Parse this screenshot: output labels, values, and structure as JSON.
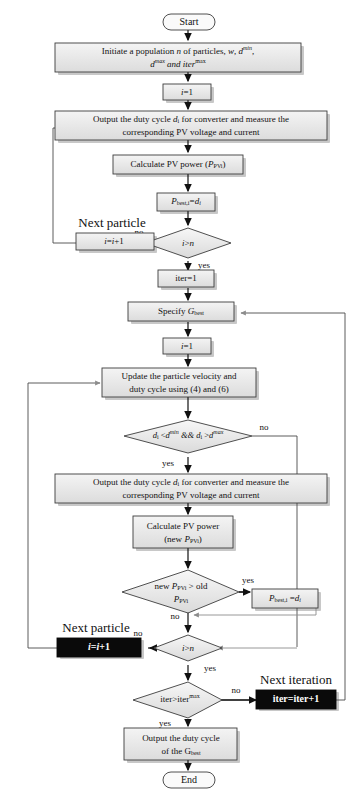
{
  "diagram": {
    "type": "flowchart",
    "colors": {
      "box_fill": "#e8e8e8",
      "box_stroke": "#3c3c3c",
      "black_box_fill": "#0a0a0a",
      "black_box_text": "#ffffff",
      "line": "#111111",
      "gray_line": "#8c8c8c",
      "shadow": "#9a9a9a"
    },
    "nodes": {
      "start": {
        "shape": "terminator",
        "label": "Start"
      },
      "initiate": {
        "shape": "process",
        "line1_a": "Initiate a population ",
        "line1_n": "n",
        "line1_b": " of particles, ",
        "line1_w": "w",
        "line1_c": ", ",
        "line1_dmin_base": "d",
        "line1_dmin_sup": "min",
        "line1_comma": ",",
        "line2_dmax_base": "d",
        "line2_dmax_sup": "max",
        "line2_and": " and iter",
        "line2_sup": "max"
      },
      "i_eq_1_first": {
        "shape": "process",
        "base": "i",
        "rest": "=1"
      },
      "output_duty_1": {
        "shape": "process",
        "line1_a": "Output the duty cycle ",
        "line1_d": "d",
        "line1_sub": "i",
        "line1_b": " for converter and measure the",
        "line2": "corresponding PV voltage and current"
      },
      "calc_power_1": {
        "shape": "process",
        "a": "Calculate PV power (",
        "p": "P",
        "sub": "PVi",
        "b": ")"
      },
      "pbest_assign": {
        "shape": "process",
        "p": "P",
        "sub": "best,i",
        "eq": "=",
        "d": "d",
        "dsub": "i"
      },
      "decision_i_gt_n_1": {
        "shape": "decision",
        "i": "i",
        "gt": ">",
        "n": "n"
      },
      "next_particle_1": {
        "shape": "process",
        "caption": "Next particle",
        "base1": "i",
        "eq": "=",
        "base2": "i",
        "plus": "+1"
      },
      "iter_eq_1": {
        "shape": "process",
        "label": "iter=1"
      },
      "specify_gbest": {
        "shape": "process",
        "a": "Specify ",
        "g": "G",
        "sub": "best"
      },
      "i_eq_1_second": {
        "shape": "process",
        "base": "i",
        "rest": "=1"
      },
      "update_velocity": {
        "shape": "process",
        "line1": "Update the particle velocity and",
        "line2": "duty cycle using (4) and (6)"
      },
      "decision_bounds": {
        "shape": "decision",
        "d1": "d",
        "d1sub": "i",
        "lt": " <",
        "dmin": "d",
        "dminsup": "min",
        "amp": " && ",
        "d2": "d",
        "d2sub": "i",
        "gt": " >",
        "dmax": "d",
        "dmaxsup": "max"
      },
      "output_duty_2": {
        "shape": "process",
        "line1_a": "Output the duty cycle ",
        "line1_d": "d",
        "line1_sub": "i",
        "line1_b": " for converter and measure the",
        "line2": "corresponding PV voltage and current"
      },
      "calc_power_2": {
        "shape": "process",
        "line1": "Calculate PV power",
        "line2_a": "(new ",
        "line2_p": "P",
        "line2_sub": "PVi",
        "line2_b": ")"
      },
      "decision_new_gt_old": {
        "shape": "decision",
        "line1_a": "new ",
        "line1_p": "P",
        "line1_sub": "PVi",
        "line1_b": " > old",
        "line2_p": "P",
        "line2_sub": "PVi"
      },
      "pbest_assign_2": {
        "shape": "process",
        "p": "P",
        "sub": "best,i",
        "eq": " =",
        "d": "d",
        "dsub": "i"
      },
      "decision_i_gt_n_2": {
        "shape": "decision",
        "i": "i",
        "gt": ">",
        "n": "n"
      },
      "next_particle_2": {
        "shape": "process_black",
        "caption": "Next particle",
        "base1": "i",
        "eq": "=",
        "base2": "i",
        "plus": "+1"
      },
      "decision_iter": {
        "shape": "decision",
        "a": "iter>iter",
        "sup": "max"
      },
      "next_iteration": {
        "shape": "process_black",
        "caption": "Next iteration",
        "label": "iter=iter+1"
      },
      "output_gbest": {
        "shape": "process",
        "line1": "Output the duty cycle",
        "line2_a": "of the G",
        "line2_sub": "best"
      },
      "end": {
        "shape": "terminator",
        "label": "End"
      }
    },
    "edge_labels": {
      "no_1": "no",
      "yes_1": "yes",
      "no_bounds": "no",
      "yes_bounds": "yes",
      "yes_new": "yes",
      "no_new": "no",
      "no_2": "no",
      "yes_2": "yes",
      "no_iter": "no",
      "yes_iter": "yes"
    }
  }
}
